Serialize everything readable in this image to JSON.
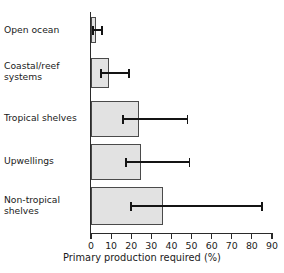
{
  "chart_data": {
    "type": "bar",
    "orientation": "horizontal",
    "title": "",
    "xlabel": "Primary production required (%)",
    "ylabel": "",
    "xlim": [
      0,
      90
    ],
    "xticks": [
      0,
      10,
      20,
      30,
      40,
      50,
      60,
      70,
      80,
      90
    ],
    "xtick_labels": [
      "0",
      "10",
      "20",
      "30",
      "40",
      "50",
      "60",
      "70",
      "80",
      "90"
    ],
    "grid": false,
    "legend": false,
    "categories": [
      "Open ocean",
      "Coastal/reef\nsystems",
      "Tropical shelves",
      "Upwellings",
      "Non-tropical\nshelves"
    ],
    "values": [
      2.5,
      9,
      24,
      25,
      36
    ],
    "error_bars": [
      {
        "category": "Open ocean",
        "low": 1.0,
        "high": 5.5
      },
      {
        "category": "Coastal/reef systems",
        "low": 5.0,
        "high": 19.0
      },
      {
        "category": "Tropical shelves",
        "low": 16.0,
        "high": 48.0
      },
      {
        "category": "Upwellings",
        "low": 17.5,
        "high": 49.0
      },
      {
        "category": "Non-tropical shelves",
        "low": 20.0,
        "high": 85.0
      }
    ],
    "colors": {
      "bar_fill": "#e2e2e2",
      "bar_edge": "#4a4a4a",
      "error_bar": "#141414",
      "axis": "#2a2a2a",
      "text": "#1a1a1a",
      "background": "#ffffff"
    }
  },
  "axis_title": "Primary production required (%)"
}
